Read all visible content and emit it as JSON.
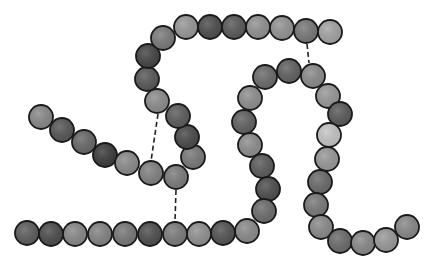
{
  "diagram": {
    "title": "Polypeptide chain bead model",
    "bead_radius": 12,
    "chains": [
      {
        "name": "chain-a",
        "beads": [
          {
            "x": 41,
            "y": 117,
            "shade": "#8a8a8a"
          },
          {
            "x": 62,
            "y": 130,
            "shade": "#585858"
          },
          {
            "x": 84,
            "y": 142,
            "shade": "#6a6a6a"
          },
          {
            "x": 105,
            "y": 155,
            "shade": "#3e3e3e"
          },
          {
            "x": 127,
            "y": 163,
            "shade": "#8c8c8c"
          },
          {
            "x": 151,
            "y": 173,
            "shade": "#838383"
          },
          {
            "x": 176,
            "y": 177,
            "shade": "#7e7e7e"
          },
          {
            "x": 193,
            "y": 157,
            "shade": "#7a7a7a"
          },
          {
            "x": 187,
            "y": 137,
            "shade": "#4c4c4c"
          },
          {
            "x": 178,
            "y": 116,
            "shade": "#5e5e5e"
          },
          {
            "x": 157,
            "y": 101,
            "shade": "#8e8e8e"
          },
          {
            "x": 147,
            "y": 79,
            "shade": "#5a5a5a"
          },
          {
            "x": 148,
            "y": 56,
            "shade": "#474747"
          },
          {
            "x": 163,
            "y": 38,
            "shade": "#7c7c7c"
          },
          {
            "x": 186,
            "y": 27,
            "shade": "#999999"
          }
        ]
      },
      {
        "name": "top-row",
        "beads": [
          {
            "x": 210,
            "y": 27,
            "shade": "#4f4f4f"
          },
          {
            "x": 234,
            "y": 27,
            "shade": "#5b5b5b"
          },
          {
            "x": 258,
            "y": 27,
            "shade": "#939393"
          },
          {
            "x": 282,
            "y": 28,
            "shade": "#959595"
          },
          {
            "x": 306,
            "y": 31,
            "shade": "#7a7a7a"
          },
          {
            "x": 330,
            "y": 32,
            "shade": "#a5a5a5"
          }
        ]
      },
      {
        "name": "loop-chain",
        "beads": [
          {
            "x": 313,
            "y": 76,
            "shade": "#8d8d8d"
          },
          {
            "x": 289,
            "y": 71,
            "shade": "#636363"
          },
          {
            "x": 265,
            "y": 77,
            "shade": "#6d6d6d"
          },
          {
            "x": 250,
            "y": 98,
            "shade": "#909090"
          },
          {
            "x": 244,
            "y": 122,
            "shade": "#636363"
          },
          {
            "x": 250,
            "y": 145,
            "shade": "#8f8f8f"
          },
          {
            "x": 262,
            "y": 166,
            "shade": "#5d5d5d"
          },
          {
            "x": 268,
            "y": 189,
            "shade": "#505050"
          },
          {
            "x": 264,
            "y": 211,
            "shade": "#6e6e6e"
          },
          {
            "x": 247,
            "y": 231,
            "shade": "#8c8c8c"
          },
          {
            "x": 223,
            "y": 233,
            "shade": "#555555"
          },
          {
            "x": 199,
            "y": 234,
            "shade": "#929292"
          },
          {
            "x": 175,
            "y": 234,
            "shade": "#7d7d7d"
          },
          {
            "x": 150,
            "y": 234,
            "shade": "#505050"
          },
          {
            "x": 125,
            "y": 234,
            "shade": "#7a7a7a"
          },
          {
            "x": 100,
            "y": 234,
            "shade": "#858585"
          },
          {
            "x": 75,
            "y": 234,
            "shade": "#8a8a8a"
          },
          {
            "x": 51,
            "y": 234,
            "shade": "#4e4e4e"
          },
          {
            "x": 27,
            "y": 233,
            "shade": "#5f5f5f"
          }
        ]
      },
      {
        "name": "right-tail",
        "beads": [
          {
            "x": 328,
            "y": 96,
            "shade": "#9a9a9a"
          },
          {
            "x": 340,
            "y": 114,
            "shade": "#5c5c5c"
          },
          {
            "x": 329,
            "y": 135,
            "shade": "#c6c6c6"
          },
          {
            "x": 327,
            "y": 159,
            "shade": "#9a9a9a"
          },
          {
            "x": 320,
            "y": 182,
            "shade": "#6c6c6c"
          },
          {
            "x": 316,
            "y": 205,
            "shade": "#7b7b7b"
          },
          {
            "x": 321,
            "y": 227,
            "shade": "#8c8c8c"
          },
          {
            "x": 340,
            "y": 241,
            "shade": "#6d6d6d"
          },
          {
            "x": 363,
            "y": 243,
            "shade": "#8a8a8a"
          },
          {
            "x": 386,
            "y": 240,
            "shade": "#9b9b9b"
          },
          {
            "x": 407,
            "y": 227,
            "shade": "#8a8a8a"
          }
        ]
      }
    ],
    "links": [
      {
        "name": "disulfide-bond-1",
        "x1": 307,
        "y1": 44,
        "x2": 309,
        "y2": 63
      },
      {
        "name": "disulfide-bond-2",
        "x1": 158,
        "y1": 114,
        "x2": 151,
        "y2": 161
      },
      {
        "name": "disulfide-bond-3",
        "x1": 176,
        "y1": 190,
        "x2": 175,
        "y2": 221
      }
    ]
  }
}
